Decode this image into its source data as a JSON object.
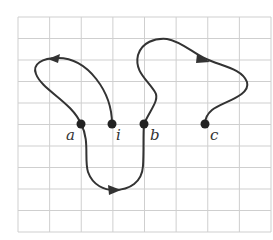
{
  "diagram": {
    "type": "graph-paper path diagram",
    "grid": {
      "x0": 18,
      "y0": 17,
      "x1": 271,
      "y1": 232,
      "cols": 8,
      "rows": 10,
      "line_color": "#cfcfcf"
    },
    "points": [
      {
        "id": "a",
        "label": "a",
        "x": 81,
        "y": 124,
        "label_x": 66,
        "label_y": 140
      },
      {
        "id": "i",
        "label": "i",
        "x": 112,
        "y": 124,
        "label_x": 116,
        "label_y": 140
      },
      {
        "id": "b",
        "label": "b",
        "x": 144,
        "y": 124,
        "label_x": 150,
        "label_y": 140
      },
      {
        "id": "c",
        "label": "c",
        "x": 205,
        "y": 124,
        "label_x": 210,
        "label_y": 140
      }
    ],
    "paths": [
      {
        "name": "path-i-to-a",
        "from": "i",
        "to": "a",
        "direction_arrow": "left",
        "d": "M112,124 C112,92 88,58 58,58 C42,58 32,64 36,74 C42,90 72,102 81,124"
      },
      {
        "name": "path-a-to-b",
        "from": "a",
        "to": "b",
        "direction_arrow": "right",
        "d": "M81,124 C90,140 84,160 88,172 C93,186 105,190 114,190 C130,190 142,182 143,166 C144,150 143,135 144,124"
      },
      {
        "name": "path-b-to-c",
        "from": "b",
        "to": "c",
        "direction_arrow": "right-down",
        "d": "M144,124 C150,110 160,100 155,92 C148,80 134,72 138,55 C142,42 155,38 167,39 C180,41 192,52 204,58 C220,66 242,68 247,82 C251,96 222,102 212,110 C206,115 205,120 205,124"
      }
    ],
    "arrows": [
      {
        "name": "arrow-left-top",
        "points": "48,59 60,54 58,63"
      },
      {
        "name": "arrow-right-bottom",
        "points": "121,190 108,185 109,195"
      },
      {
        "name": "arrow-right-top",
        "points": "210,62 197,54 196,63"
      }
    ],
    "stroke_color": "#333333",
    "point_color": "#222222"
  }
}
